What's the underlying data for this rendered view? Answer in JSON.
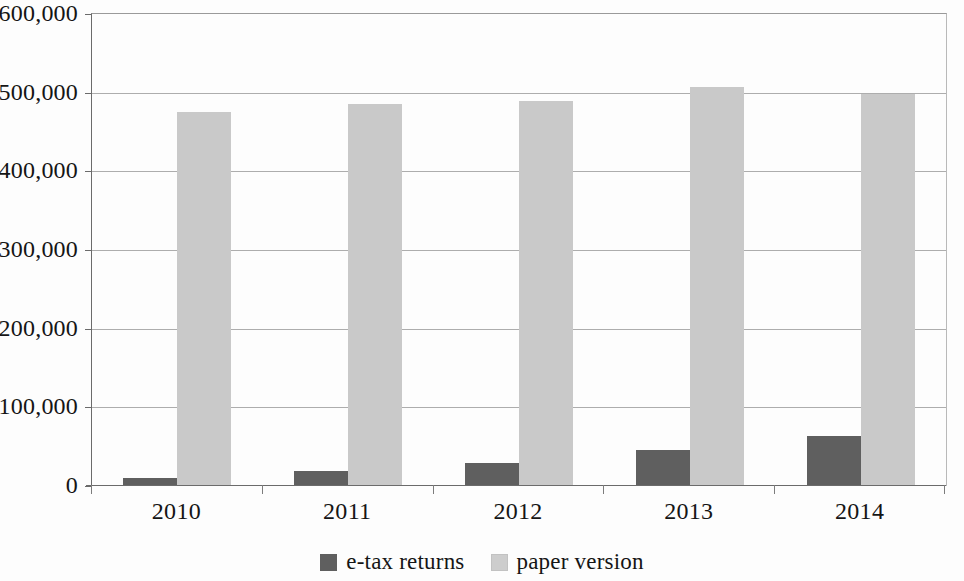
{
  "chart_data": {
    "type": "bar",
    "title": "",
    "subtitle": "",
    "xlabel": "",
    "ylabel": "",
    "categories": [
      "2010",
      "2011",
      "2012",
      "2013",
      "2014"
    ],
    "series": [
      {
        "name": "e-tax returns",
        "color": "#5f5f5f",
        "values": [
          10000,
          19000,
          29000,
          46000,
          64000
        ]
      },
      {
        "name": "paper version",
        "color": "#c9c9c9",
        "values": [
          476000,
          486000,
          489000,
          507000,
          498000
        ]
      }
    ],
    "ylim": [
      0,
      600000
    ],
    "ytick_values": [
      0,
      100000,
      200000,
      300000,
      400000,
      500000,
      600000
    ],
    "ytick_labels": [
      "0",
      "100,000",
      "200,000",
      "300,000",
      "400,000",
      "500,000",
      "600,000"
    ],
    "grid": "horizontal",
    "legend_position": "bottom-center"
  },
  "legend": {
    "items": [
      {
        "label": "e-tax returns",
        "swatch": "dark-swatch-icon"
      },
      {
        "label": "paper version",
        "swatch": "light-swatch-icon"
      }
    ]
  }
}
